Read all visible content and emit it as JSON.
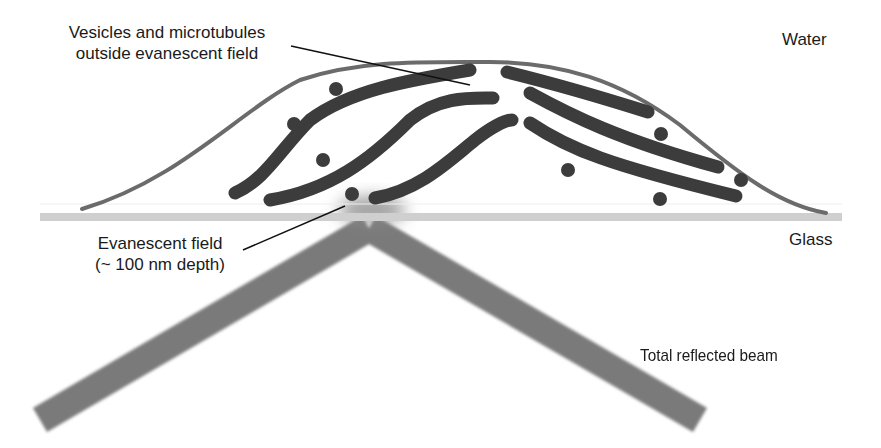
{
  "labels": {
    "vesicles_line1": "Vesicles and microtubules",
    "vesicles_line2": "outside evanescent field",
    "water": "Water",
    "glass": "Glass",
    "evanescent_line1": "Evanescent field",
    "evanescent_line2": "(~ 100 nm depth)",
    "reflected_beam": "Total reflected beam"
  },
  "colors": {
    "cell_outline": "#6b6b6b",
    "microtubule": "#3c3c3c",
    "vesicle": "#3c3c3c",
    "glass": "#cfcfcf",
    "beam": "#7a7a7a",
    "leader_line": "#111111",
    "text": "#1a1a1a"
  }
}
